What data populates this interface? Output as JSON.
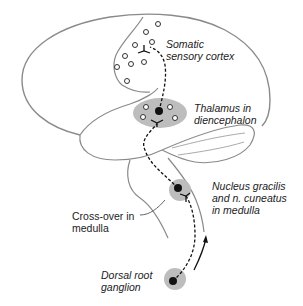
{
  "diagram": {
    "type": "anatomical pathway diagram",
    "colors": {
      "outline": "#8a8a8a",
      "region_fill": "#bdbdbd",
      "pathway": "#111111",
      "text": "#222222"
    },
    "labels": {
      "somatic_cortex": "Somatic\nsensory cortex",
      "thalamus": "Thalamus in\ndiencephalon",
      "nucleus": "Nucleus gracilis\nand n. cuneatus\nin medulla",
      "crossover": "Cross-over in\nmedulla",
      "dorsal_root": "Dorsal root\nganglion"
    },
    "nodes": [
      {
        "name": "Dorsal root ganglion",
        "kind": "first-order neuron"
      },
      {
        "name": "Nucleus gracilis and n. cuneatus in medulla",
        "kind": "second-order neuron"
      },
      {
        "name": "Cross-over in medulla",
        "kind": "decussation"
      },
      {
        "name": "Thalamus in diencephalon",
        "kind": "third-order neuron"
      },
      {
        "name": "Somatic sensory cortex",
        "kind": "cortical target"
      }
    ],
    "arrow": "upward, indicating ascending direction of signal"
  }
}
